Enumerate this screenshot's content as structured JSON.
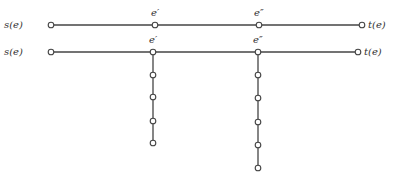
{
  "diagram": {
    "rows": [
      {
        "id": "row-1",
        "y": 25,
        "start": {
          "label": "s(e)",
          "x": 51
        },
        "end": {
          "label": "t(e)",
          "x": 362
        },
        "mid_nodes": [
          {
            "label": "e′",
            "x": 155
          },
          {
            "label": "e″",
            "x": 259
          }
        ]
      },
      {
        "id": "row-2",
        "y": 52,
        "start": {
          "label": "s(e)",
          "x": 51
        },
        "end": {
          "label": "t(e)",
          "x": 358
        },
        "mid_nodes": [
          {
            "label": "e′",
            "x": 153
          },
          {
            "label": "e″",
            "x": 258
          }
        ]
      }
    ],
    "branches": [
      {
        "from": "e′",
        "x": 153,
        "node_ys": [
          52,
          75,
          97,
          121,
          143
        ]
      },
      {
        "from": "e″",
        "x": 258,
        "node_ys": [
          52,
          75,
          98,
          122,
          145,
          168
        ]
      }
    ],
    "colors": {
      "line": "#444444",
      "text": "#333333",
      "background": "#ffffff"
    }
  },
  "labels": {
    "r1_start": "s(e)",
    "r1_end": "t(e)",
    "r1_m1": "e′",
    "r1_m2": "e″",
    "r2_start": "s(e)",
    "r2_end": "t(e)",
    "r2_m1": "e′",
    "r2_m2": "e″"
  }
}
